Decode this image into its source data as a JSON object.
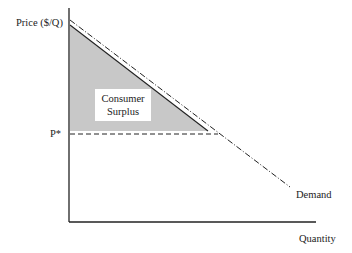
{
  "diagram": {
    "y_axis_label": "Price ($/Q)",
    "x_axis_label": "Quantity",
    "price_marker_label": "P*",
    "curve_label": "Demand",
    "area_label_line1": "Consumer",
    "area_label_line2": "Surplus",
    "colors": {
      "axis": "#222222",
      "shade": "#c8c8c8",
      "line": "#222222"
    }
  }
}
